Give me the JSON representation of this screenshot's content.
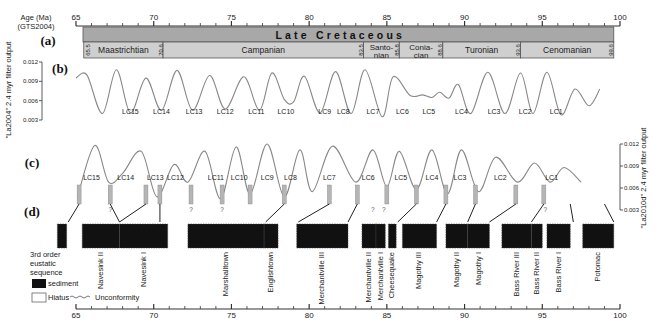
{
  "chart_data": {
    "type": "line",
    "x_axis": {
      "label": "Age (Ma)",
      "sublabel": "(GTS2004)",
      "range": [
        65,
        100
      ],
      "ticks": [
        65,
        70,
        75,
        80,
        85,
        90,
        95,
        100
      ],
      "minor_step": 1
    },
    "panel_a": {
      "label": "(a)",
      "era": "Late Cretaceous",
      "stages": [
        {
          "name": "Maastrichtian",
          "start": 65.5,
          "end": 70.6
        },
        {
          "name": "Campanian",
          "start": 70.6,
          "end": 83.5
        },
        {
          "name": "Santo-nian",
          "start": 83.5,
          "end": 85.8
        },
        {
          "name": "Conia-cian",
          "start": 85.8,
          "end": 88.6
        },
        {
          "name": "Turonian",
          "start": 88.6,
          "end": 93.6
        },
        {
          "name": "Cenomanian",
          "start": 93.6,
          "end": 99.6
        }
      ],
      "boundaries": [
        "65.5",
        "70.6",
        "83.5",
        "85.8",
        "88.6",
        "93.6",
        "99.6"
      ]
    },
    "panel_b": {
      "label": "(b)",
      "ylabel": "\"La2004\" 2.4 myr filter output",
      "yticks": [
        "0.012",
        "0.009",
        "0.006",
        "0.003"
      ],
      "ylim": [
        0.003,
        0.012
      ],
      "cycles": [
        "LC15",
        "LC14",
        "LC13",
        "LC12",
        "LC11",
        "LC10",
        "LC9",
        "LC8",
        "LC7",
        "LC6",
        "LC5",
        "LC4",
        "LC3",
        "LC2",
        "LC1"
      ],
      "series": [
        {
          "name": "La2004",
          "x": [
            65,
            65.7,
            66.7,
            67.6,
            68.5,
            69.5,
            70.5,
            71.5,
            72.5,
            73.6,
            74.6,
            75.8,
            76.8,
            77.6,
            78.4,
            79.0,
            79.7,
            80.7,
            81.7,
            82.7,
            83.6,
            84.7,
            85.4,
            86.5,
            87.3,
            87.9,
            88.4,
            89.0,
            89.6,
            90.4,
            91.5,
            92.6,
            93.6,
            94.4,
            95.3,
            96.2,
            97.1,
            98.0,
            98.7
          ],
          "y": [
            0.0095,
            0.01,
            0.004,
            0.0108,
            0.0041,
            0.0095,
            0.0045,
            0.0107,
            0.0045,
            0.0099,
            0.0047,
            0.0097,
            0.0045,
            0.0103,
            0.0062,
            0.0058,
            0.0098,
            0.0041,
            0.0105,
            0.004,
            0.0108,
            0.0035,
            0.0097,
            0.0068,
            0.0069,
            0.0065,
            0.0073,
            0.0064,
            0.0085,
            0.004,
            0.0104,
            0.004,
            0.0103,
            0.004,
            0.0104,
            0.0038,
            0.0078,
            0.0052,
            0.0078
          ]
        }
      ]
    },
    "panel_c": {
      "label": "(c)",
      "ylabel": "\"La2010d\" 2.4 myr filter output",
      "yticks": [
        "0.012",
        "0.009",
        "0.006",
        "0.003"
      ],
      "ylim": [
        0.003,
        0.012
      ],
      "cycles": [
        "LC15",
        "LC14",
        "LC13",
        "LC12",
        "LC11",
        "LC10",
        "LC9",
        "LC8",
        "LC7",
        "LC6",
        "LC5",
        "LC4",
        "LC3",
        "LC2",
        "LC1"
      ],
      "series": [
        {
          "name": "La2010d",
          "x": [
            65.1,
            66.2,
            67.1,
            68.0,
            69.2,
            70.2,
            71.3,
            72.2,
            73.3,
            74.3,
            75.3,
            76.2,
            77.3,
            78.4,
            79.4,
            80.2,
            81.5,
            83.0,
            84.1,
            85.0,
            85.8,
            86.9,
            87.9,
            88.9,
            89.8,
            90.9,
            92.0,
            93.4,
            94.5,
            95.5,
            96.4,
            97.5
          ],
          "y": [
            0.0048,
            0.0118,
            0.0068,
            0.008,
            0.011,
            0.0048,
            0.0092,
            0.0068,
            0.011,
            0.0045,
            0.0116,
            0.0052,
            0.012,
            0.0048,
            0.0112,
            0.0055,
            0.0117,
            0.0068,
            0.0112,
            0.0062,
            0.011,
            0.0058,
            0.0112,
            0.0052,
            0.0112,
            0.0055,
            0.0102,
            0.0068,
            0.0094,
            0.0068,
            0.0088,
            0.0068
          ]
        }
      ],
      "minima_markers": [
        65.2,
        67.2,
        69.5,
        70.4,
        72.4,
        74.4,
        76.2,
        78.4,
        81.3,
        83.1,
        85.0,
        86.9,
        88.8,
        90.7,
        93.3,
        95.1
      ]
    },
    "panel_d": {
      "label": "(d)",
      "title": "3rd order eustatic sequence",
      "legend": {
        "sediment": "sediment",
        "hiatus": "Hiatus",
        "unconformity": "Unconformity"
      },
      "sequences": [
        {
          "name": "",
          "start": 63.8,
          "end": 64.4
        },
        {
          "name": "Navesink II",
          "start": 65.4,
          "end": 67.8
        },
        {
          "name": "Navesink I",
          "start": 67.8,
          "end": 70.9
        },
        {
          "name": "Marshalltown",
          "start": 72.2,
          "end": 77.1
        },
        {
          "name": "Englishtown",
          "start": 77.1,
          "end": 78.0
        },
        {
          "name": "Merchantville III",
          "start": 79.2,
          "end": 82.5
        },
        {
          "name": "Merchantville II",
          "start": 83.4,
          "end": 84.3
        },
        {
          "name": "Merchantville I",
          "start": 84.3,
          "end": 84.9
        },
        {
          "name": "Cheesequake",
          "start": 85.1,
          "end": 85.6
        },
        {
          "name": "Magothy III",
          "start": 86.0,
          "end": 88.2
        },
        {
          "name": "Magothy II",
          "start": 88.8,
          "end": 90.2
        },
        {
          "name": "Magothy I",
          "start": 90.2,
          "end": 91.6
        },
        {
          "name": "Bass River III",
          "start": 92.4,
          "end": 94.3
        },
        {
          "name": "Bass River II",
          "start": 94.3,
          "end": 95.0
        },
        {
          "name": "Bass River I",
          "start": 95.3,
          "end": 96.8
        },
        {
          "name": "Potomac",
          "start": 97.6,
          "end": 99.6
        }
      ],
      "question_marks": [
        67.2,
        72.4,
        74.4,
        84.1,
        84.8,
        95.2
      ]
    }
  },
  "colors": {
    "era_bar": "#a8a8a8",
    "stage_bar": "#cfcfcf",
    "curve": "#888888",
    "marker": "#9a9a9a",
    "sediment": "#111111",
    "axis": "#333333"
  }
}
